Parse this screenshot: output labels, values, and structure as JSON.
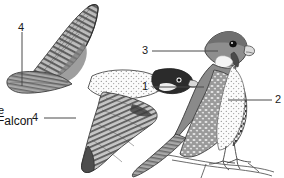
{
  "figure": {
    "background_color": "#ffffff",
    "ink_color": "#4a4a4a",
    "text_color": "#1a1a1a",
    "width": 284,
    "height": 178
  },
  "caption": {
    "species_label": "Falcon",
    "clipped_mark": "e"
  },
  "specimens": [
    {
      "name": "flying-falcon",
      "pose": "in flight, ventral view, wings raised",
      "position": "left"
    },
    {
      "name": "perched-falcon",
      "pose": "perched on branch, lateral view",
      "position": "right"
    }
  ],
  "callouts": [
    {
      "id": "callout-4-upper-wing",
      "label": "4",
      "leader": "vertical",
      "target": "flying falcon upper wing"
    },
    {
      "id": "callout-4-lower-wing",
      "label": "4",
      "leader": "horizontal",
      "target": "flying falcon lower wing"
    },
    {
      "id": "callout-3-head",
      "label": "3",
      "leader": "horizontal",
      "target": "perched falcon head malar stripe"
    },
    {
      "id": "callout-1-back",
      "label": "1",
      "leader": "horizontal",
      "target": "perched falcon back and wing coverts"
    },
    {
      "id": "callout-2-primaries",
      "label": "2",
      "leader": "horizontal",
      "target": "perched falcon barred primaries"
    }
  ]
}
